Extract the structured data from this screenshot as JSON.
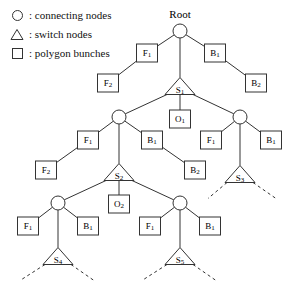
{
  "figure": {
    "title": "Root",
    "root_caption": "Root"
  },
  "legend": {
    "items": [
      {
        "glyph": "circle",
        "icon_name": "circle-icon",
        "separator": ":",
        "label": "connecting nodes"
      },
      {
        "glyph": "triangle",
        "icon_name": "triangle-icon",
        "separator": ":",
        "label": "switch nodes"
      },
      {
        "glyph": "square",
        "icon_name": "square-icon",
        "separator": ":",
        "label": "polygon bunches"
      }
    ]
  },
  "nodes": [
    {
      "id": "root",
      "type": "circle",
      "label": "",
      "x": 180,
      "y": 31
    },
    {
      "id": "f1a",
      "type": "square",
      "label": "F1",
      "x": 147,
      "y": 53
    },
    {
      "id": "b1a",
      "type": "square",
      "label": "B1",
      "x": 215,
      "y": 53
    },
    {
      "id": "f2a",
      "type": "square",
      "label": "F2",
      "x": 108,
      "y": 83
    },
    {
      "id": "b2a",
      "type": "square",
      "label": "B2",
      "x": 256,
      "y": 83
    },
    {
      "id": "s1",
      "type": "triangle",
      "label": "S1",
      "x": 180,
      "y": 86
    },
    {
      "id": "o1",
      "type": "square",
      "label": "O1",
      "x": 180,
      "y": 119
    },
    {
      "id": "c2l",
      "type": "circle",
      "label": "",
      "x": 119,
      "y": 117
    },
    {
      "id": "c2r",
      "type": "circle",
      "label": "",
      "x": 240,
      "y": 117
    },
    {
      "id": "f1b",
      "type": "square",
      "label": "F1",
      "x": 88,
      "y": 140
    },
    {
      "id": "b1b",
      "type": "square",
      "label": "B1",
      "x": 152,
      "y": 140
    },
    {
      "id": "f1c",
      "type": "square",
      "label": "F1",
      "x": 211,
      "y": 140
    },
    {
      "id": "b1c",
      "type": "square",
      "label": "B1",
      "x": 271,
      "y": 140
    },
    {
      "id": "f2b",
      "type": "square",
      "label": "F2",
      "x": 46,
      "y": 170
    },
    {
      "id": "b2b",
      "type": "square",
      "label": "B2",
      "x": 195,
      "y": 170
    },
    {
      "id": "s2",
      "type": "triangle",
      "label": "S2",
      "x": 119,
      "y": 172
    },
    {
      "id": "s3",
      "type": "triangle",
      "label": "S3",
      "x": 240,
      "y": 174
    },
    {
      "id": "o2",
      "type": "square",
      "label": "O2",
      "x": 119,
      "y": 204
    },
    {
      "id": "c3l",
      "type": "circle",
      "label": "",
      "x": 58,
      "y": 203
    },
    {
      "id": "c3r",
      "type": "circle",
      "label": "",
      "x": 180,
      "y": 203
    },
    {
      "id": "f1d",
      "type": "square",
      "label": "F1",
      "x": 28,
      "y": 226
    },
    {
      "id": "b1d",
      "type": "square",
      "label": "B1",
      "x": 88,
      "y": 226
    },
    {
      "id": "f1e",
      "type": "square",
      "label": "F1",
      "x": 150,
      "y": 226
    },
    {
      "id": "b1e",
      "type": "square",
      "label": "B1",
      "x": 210,
      "y": 226
    },
    {
      "id": "s4",
      "type": "triangle",
      "label": "S4",
      "x": 58,
      "y": 256
    },
    {
      "id": "s5",
      "type": "triangle",
      "label": "S5",
      "x": 180,
      "y": 256
    }
  ],
  "edges": [
    {
      "from": "root",
      "to": "f1a",
      "style": "solid"
    },
    {
      "from": "root",
      "to": "b1a",
      "style": "solid"
    },
    {
      "from": "root",
      "to": "s1",
      "style": "solid"
    },
    {
      "from": "f1a",
      "to": "f2a",
      "style": "solid"
    },
    {
      "from": "b1a",
      "to": "b2a",
      "style": "solid"
    },
    {
      "from": "s1",
      "to": "c2l",
      "style": "solid"
    },
    {
      "from": "s1",
      "to": "o1",
      "style": "solid"
    },
    {
      "from": "s1",
      "to": "c2r",
      "style": "solid"
    },
    {
      "from": "c2l",
      "to": "f1b",
      "style": "solid"
    },
    {
      "from": "c2l",
      "to": "b1b",
      "style": "solid"
    },
    {
      "from": "c2l",
      "to": "s2",
      "style": "solid"
    },
    {
      "from": "c2r",
      "to": "f1c",
      "style": "solid"
    },
    {
      "from": "c2r",
      "to": "b1c",
      "style": "solid"
    },
    {
      "from": "c2r",
      "to": "s3",
      "style": "solid"
    },
    {
      "from": "f1b",
      "to": "f2b",
      "style": "solid"
    },
    {
      "from": "b1b",
      "to": "b2b",
      "style": "solid"
    },
    {
      "from": "s2",
      "to": "c3l",
      "style": "solid"
    },
    {
      "from": "s2",
      "to": "o2",
      "style": "solid"
    },
    {
      "from": "s2",
      "to": "c3r",
      "style": "solid"
    },
    {
      "from": "c3l",
      "to": "f1d",
      "style": "solid"
    },
    {
      "from": "c3l",
      "to": "b1d",
      "style": "solid"
    },
    {
      "from": "c3l",
      "to": "s4",
      "style": "solid"
    },
    {
      "from": "c3r",
      "to": "f1e",
      "style": "solid"
    },
    {
      "from": "c3r",
      "to": "b1e",
      "style": "solid"
    },
    {
      "from": "c3r",
      "to": "s5",
      "style": "solid"
    }
  ],
  "dashed_stubs": [
    {
      "from": "s3",
      "dx": -32,
      "dy": 16
    },
    {
      "from": "s3",
      "dx": 36,
      "dy": 16
    },
    {
      "from": "s4",
      "dx": -38,
      "dy": 16
    },
    {
      "from": "s4",
      "dx": 36,
      "dy": 16
    },
    {
      "from": "s5",
      "dx": -38,
      "dy": 16
    },
    {
      "from": "s5",
      "dx": 36,
      "dy": 16
    }
  ],
  "style": {
    "stroke": "#333333",
    "fill": "#ffffff",
    "text": "#000000",
    "background": "#ffffff"
  }
}
